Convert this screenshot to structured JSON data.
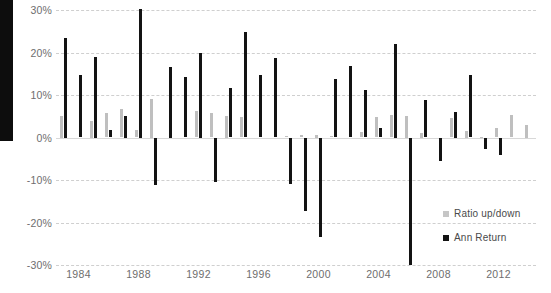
{
  "chart_data": {
    "type": "bar",
    "title": "",
    "subtitle": "",
    "xlabel": "",
    "ylabel": "",
    "ylim": [
      -30,
      30
    ],
    "ytick_labels": [
      "30%",
      "20%",
      "10%",
      "0%",
      "-10%",
      "-20%",
      "-30%"
    ],
    "ytick_values": [
      30,
      20,
      10,
      0,
      -10,
      -20,
      -30
    ],
    "xtick_labels": [
      "1984",
      "1988",
      "1992",
      "1996",
      "2000",
      "2004",
      "2008",
      "2012"
    ],
    "xtick_values": [
      1984,
      1988,
      1992,
      1996,
      2000,
      2004,
      2008,
      2012
    ],
    "grid": true,
    "legend_position": "inside-bottom-right",
    "categories": [
      1983,
      1984,
      1985,
      1986,
      1987,
      1988,
      1989,
      1990,
      1991,
      1992,
      1993,
      1994,
      1995,
      1996,
      1997,
      1998,
      1999,
      2000,
      2001,
      2002,
      2003,
      2004,
      2005,
      2006,
      2007,
      2008,
      2009,
      2010,
      2011,
      2012,
      2013,
      2014
    ],
    "series": [
      {
        "name": "Ratio up/down",
        "color": "#bfbfbf",
        "values": [
          5.0,
          0.0,
          4.0,
          5.8,
          6.8,
          1.8,
          9.0,
          0.0,
          0.0,
          6.2,
          5.8,
          5.0,
          4.8,
          0.0,
          0.0,
          0.4,
          0.6,
          0.5,
          0.4,
          0.0,
          1.2,
          4.8,
          5.2,
          5.0,
          1.0,
          0.0,
          4.6,
          1.5,
          0.2,
          2.2,
          5.2,
          3.0
        ]
      },
      {
        "name": "Ann Return",
        "color": "#131313",
        "values": [
          23.5,
          14.8,
          19.0,
          1.8,
          5.0,
          30.2,
          -11.2,
          16.5,
          14.3,
          20.0,
          -10.5,
          11.6,
          24.8,
          14.8,
          18.8,
          -11.0,
          -17.4,
          -23.3,
          13.8,
          16.8,
          11.2,
          2.3,
          22.0,
          -30.0,
          8.8,
          -5.5,
          6.0,
          14.8,
          -2.6,
          -4.2,
          0.0,
          0.0
        ]
      }
    ],
    "legend": [
      {
        "key": "ratio",
        "label": "Ratio up/down",
        "color": "#bfbfbf"
      },
      {
        "key": "return",
        "label": "Ann Return",
        "color": "#131313"
      }
    ],
    "accent_colors": {
      "bar_return": "#131313",
      "bar_ratio": "#bfbfbf",
      "gridline": "#cfcfcf",
      "axis_text": "#6e6e6e",
      "legend_text": "#4a4a4a",
      "background": "#ffffff"
    }
  }
}
